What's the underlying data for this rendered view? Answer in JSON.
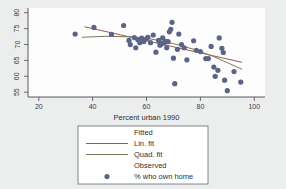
{
  "chart_data": {
    "type": "scatter",
    "title": "",
    "xlabel": "Percent urban 1990",
    "ylabel": "",
    "xlim": [
      16,
      104
    ],
    "ylim": [
      53.5,
      81.5
    ],
    "xticks": [
      20,
      40,
      60,
      80,
      100
    ],
    "yticks": [
      55,
      60,
      65,
      70,
      75,
      80
    ],
    "xtick_labels": [
      "20",
      "40",
      "60",
      "80",
      "100"
    ],
    "ytick_labels": [
      "55",
      "60",
      "65",
      "70",
      "75",
      "80"
    ],
    "grid": false,
    "legend_position": "below-axes",
    "marker_color": "#5b6386",
    "lin_fit_color": "#9c5a4a",
    "quad_fit_color": "#79795c",
    "series": [
      {
        "name": "% who own home",
        "type": "scatter",
        "points": [
          [
            33.5,
            73.3
          ],
          [
            40.5,
            75.4
          ],
          [
            47.0,
            73.2
          ],
          [
            51.5,
            76.0
          ],
          [
            53.5,
            71.3
          ],
          [
            54.0,
            70.0
          ],
          [
            55.5,
            72.2
          ],
          [
            56.0,
            69.0
          ],
          [
            56.8,
            71.5
          ],
          [
            57.5,
            70.6
          ],
          [
            58.2,
            72.0
          ],
          [
            59.0,
            71.0
          ],
          [
            60.0,
            71.8
          ],
          [
            60.5,
            72.3
          ],
          [
            61.5,
            70.6
          ],
          [
            62.5,
            73.0
          ],
          [
            63.5,
            67.6
          ],
          [
            64.5,
            71.3
          ],
          [
            65.0,
            69.8
          ],
          [
            65.5,
            70.2
          ],
          [
            66.0,
            72.1
          ],
          [
            66.5,
            70.5
          ],
          [
            67.0,
            71.0
          ],
          [
            67.5,
            69.0
          ],
          [
            68.0,
            70.9
          ],
          [
            68.5,
            74.0
          ],
          [
            69.0,
            74.8
          ],
          [
            69.5,
            77.0
          ],
          [
            70.0,
            65.7
          ],
          [
            70.5,
            57.7
          ],
          [
            71.5,
            68.5
          ],
          [
            72.0,
            73.3
          ],
          [
            73.0,
            70.0
          ],
          [
            74.0,
            69.0
          ],
          [
            75.0,
            65.2
          ],
          [
            77.5,
            71.2
          ],
          [
            78.5,
            68.2
          ],
          [
            80.0,
            67.8
          ],
          [
            82.0,
            65.6
          ],
          [
            83.0,
            65.6
          ],
          [
            84.0,
            69.4
          ],
          [
            85.0,
            62.9
          ],
          [
            85.5,
            60.0
          ],
          [
            86.5,
            61.9
          ],
          [
            87.0,
            72.1
          ],
          [
            88.0,
            68.8
          ],
          [
            88.5,
            67.5
          ],
          [
            89.0,
            58.8
          ],
          [
            90.0,
            55.5
          ],
          [
            92.5,
            61.5
          ],
          [
            95.0,
            58.2
          ]
        ]
      },
      {
        "name": "Lin. fit",
        "type": "line",
        "points": [
          [
            37.0,
            75.6
          ],
          [
            95.5,
            64.4
          ]
        ]
      },
      {
        "name": "Quad. fit",
        "type": "line",
        "points": [
          [
            36.0,
            72.3
          ],
          [
            45.0,
            72.6
          ],
          [
            55.0,
            72.4
          ],
          [
            62.0,
            71.7
          ],
          [
            70.0,
            70.3
          ],
          [
            78.0,
            68.4
          ],
          [
            85.0,
            66.2
          ],
          [
            90.0,
            64.3
          ],
          [
            95.5,
            62.2
          ]
        ]
      }
    ],
    "legend": {
      "entries": [
        {
          "label": "Fitted",
          "kind": "header"
        },
        {
          "label": "Lin. fit",
          "kind": "line",
          "color": "#9c5a4a"
        },
        {
          "label": "Quad. fit",
          "kind": "line",
          "color": "#79795c"
        },
        {
          "label": "Observed",
          "kind": "header"
        },
        {
          "label": "% who own home",
          "kind": "marker",
          "color": "#5b6386"
        }
      ]
    }
  }
}
